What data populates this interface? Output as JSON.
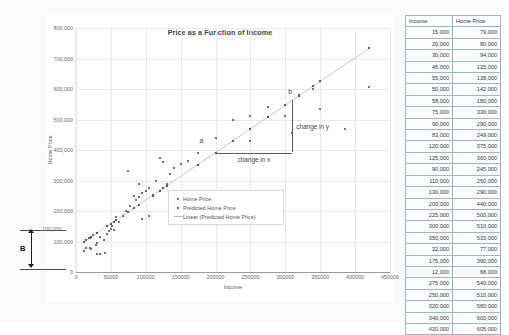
{
  "chart_data": {
    "type": "scatter",
    "title": "Price as a Function of Income",
    "xlabel": "Income",
    "ylabel": "Home Price",
    "xlim": [
      0,
      450000
    ],
    "ylim": [
      0,
      800000
    ],
    "xticks": [
      "0",
      "50000",
      "100000",
      "150000",
      "200000",
      "250000",
      "300000",
      "350000",
      "400000",
      "450000"
    ],
    "xtick_values": [
      0,
      50000,
      100000,
      150000,
      200000,
      250000,
      300000,
      350000,
      400000,
      450000
    ],
    "yticks": [
      "0",
      "100,000",
      "200,000",
      "300,000",
      "400,000",
      "500,000",
      "600,000",
      "700,000",
      "800,000"
    ],
    "ytick_values": [
      0,
      100000,
      200000,
      300000,
      400000,
      500000,
      600000,
      700000,
      800000
    ],
    "grid": true,
    "legend_position": "inside-lower-center",
    "legend": [
      {
        "label": "Home Price",
        "marker": "square"
      },
      {
        "label": "Predicted Home Price",
        "marker": "square"
      },
      {
        "label": "Linear (Predicted Home Price)",
        "marker": "line"
      }
    ],
    "series": [
      {
        "name": "Home Price",
        "points": [
          [
            15000,
            79000
          ],
          [
            20000,
            80000
          ],
          [
            30000,
            94000
          ],
          [
            45000,
            125000
          ],
          [
            55000,
            138000
          ],
          [
            50000,
            142000
          ],
          [
            58000,
            180000
          ],
          [
            75000,
            330000
          ],
          [
            90000,
            290000
          ],
          [
            83000,
            249000
          ],
          [
            120000,
            375000
          ],
          [
            125000,
            360000
          ],
          [
            90000,
            245000
          ],
          [
            110000,
            250000
          ],
          [
            130000,
            290000
          ],
          [
            200000,
            440000
          ],
          [
            225000,
            500000
          ],
          [
            300000,
            510000
          ],
          [
            350000,
            533000
          ],
          [
            22000,
            77000
          ],
          [
            175000,
            390000
          ],
          [
            12000,
            68000
          ],
          [
            275000,
            540000
          ],
          [
            250000,
            510000
          ],
          [
            320000,
            580000
          ],
          [
            340000,
            600000
          ],
          [
            420000,
            605000
          ],
          [
            18000,
            110000
          ],
          [
            25000,
            120000
          ],
          [
            28000,
            90000
          ],
          [
            35000,
            115000
          ],
          [
            40000,
            105000
          ],
          [
            48000,
            135000
          ],
          [
            52000,
            150000
          ],
          [
            62000,
            165000
          ],
          [
            68000,
            185000
          ],
          [
            72000,
            200000
          ],
          [
            78000,
            215000
          ],
          [
            86000,
            235000
          ],
          [
            95000,
            260000
          ],
          [
            100000,
            265000
          ],
          [
            105000,
            275000
          ],
          [
            115000,
            300000
          ],
          [
            135000,
            320000
          ],
          [
            140000,
            340000
          ],
          [
            150000,
            355000
          ],
          [
            160000,
            365000
          ],
          [
            95000,
            175000
          ],
          [
            105000,
            185000
          ],
          [
            30000,
            60000
          ],
          [
            35000,
            58000
          ],
          [
            42000,
            62000
          ],
          [
            250000,
            430000
          ],
          [
            310000,
            455000
          ],
          [
            385000,
            470000
          ]
        ]
      },
      {
        "name": "Predicted Home Price",
        "points": [
          [
            12000,
            100000
          ],
          [
            15000,
            105000
          ],
          [
            20000,
            112000
          ],
          [
            22000,
            115000
          ],
          [
            30000,
            127000
          ],
          [
            45000,
            150000
          ],
          [
            50000,
            158000
          ],
          [
            55000,
            165000
          ],
          [
            58000,
            170000
          ],
          [
            75000,
            196000
          ],
          [
            83000,
            209000
          ],
          [
            90000,
            220000
          ],
          [
            110000,
            251000
          ],
          [
            120000,
            267000
          ],
          [
            125000,
            274000
          ],
          [
            130000,
            282000
          ],
          [
            175000,
            352000
          ],
          [
            200000,
            391000
          ],
          [
            225000,
            430000
          ],
          [
            250000,
            469000
          ],
          [
            275000,
            508000
          ],
          [
            300000,
            547000
          ],
          [
            320000,
            578000
          ],
          [
            340000,
            609000
          ],
          [
            350000,
            625000
          ],
          [
            420000,
            734000
          ]
        ]
      }
    ],
    "trendline": {
      "name": "Linear (Predicted Home Price)",
      "intercept": 81000,
      "slope": 1.554,
      "x_start": 10000,
      "x_end": 422000
    },
    "annotations": {
      "point_a_label": "a",
      "point_b_label": "b",
      "change_in_x_label": "change in x",
      "change_in_y_label": "change in y",
      "intercept_label": "B",
      "intercept_value_label": "100,000"
    }
  },
  "table": {
    "headers": [
      "Income",
      "Home Price"
    ],
    "rows": [
      [
        "15,000",
        "79,000"
      ],
      [
        "20,000",
        "80,000"
      ],
      [
        "30,000",
        "94,000"
      ],
      [
        "45,000",
        "125,000"
      ],
      [
        "55,000",
        "138,000"
      ],
      [
        "50,000",
        "142,000"
      ],
      [
        "58,000",
        "180,000"
      ],
      [
        "75,000",
        "330,000"
      ],
      [
        "90,000",
        "290,000"
      ],
      [
        "83,000",
        "249,000"
      ],
      [
        "120,000",
        "375,000"
      ],
      [
        "125,000",
        "360,000"
      ],
      [
        "90,000",
        "245,000"
      ],
      [
        "110,000",
        "250,000"
      ],
      [
        "130,000",
        "290,000"
      ],
      [
        "200,000",
        "440,000"
      ],
      [
        "225,000",
        "500,000"
      ],
      [
        "300,000",
        "510,000"
      ],
      [
        "350,000",
        "533,000"
      ],
      [
        "22,000",
        "77,000"
      ],
      [
        "175,000",
        "390,000"
      ],
      [
        "12,000",
        "68,000"
      ],
      [
        "275,000",
        "540,000"
      ],
      [
        "250,000",
        "510,000"
      ],
      [
        "320,000",
        "580,000"
      ],
      [
        "340,000",
        "600,000"
      ],
      [
        "420,000",
        "605,000"
      ]
    ]
  }
}
